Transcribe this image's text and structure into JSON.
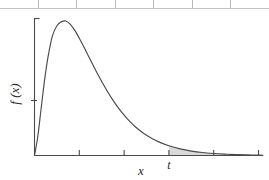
{
  "figure": {
    "title": "",
    "y_axis_label": "f (x)",
    "x_axis_label": "x",
    "t_label": "t",
    "curve_color": "#4a4a4a",
    "axis_color": "#4a4a4a",
    "shade_color": "#d9d9d9",
    "background": "#ffffff"
  },
  "table_strip": {
    "cells": [
      "",
      "",
      "",
      "",
      "",
      "",
      ""
    ],
    "border_color": "#b9b9b9"
  },
  "chart_data": {
    "type": "line",
    "title": "",
    "xlabel": "x",
    "ylabel": "f (x)",
    "xlim": [
      0,
      10.2
    ],
    "ylim": [
      0,
      1.0
    ],
    "grid": false,
    "legend": null,
    "axis_ticks": {
      "x": [
        0,
        2,
        4,
        6,
        8,
        10
      ],
      "x_tick_labels": [
        "",
        "",
        "",
        "t",
        "",
        ""
      ],
      "y": [
        0.3
      ],
      "y_tick_labels": [
        ""
      ]
    },
    "annotations": [
      {
        "text": "t",
        "x": 6,
        "y": 0,
        "role": "critical-value-marker"
      }
    ],
    "shaded_region": {
      "label": "upper tail area",
      "from_x": 6,
      "to_x": 10.2,
      "fill": "#d9d9d9"
    },
    "series": [
      {
        "name": "density",
        "x": [
          0.0,
          0.15,
          0.3,
          0.45,
          0.6,
          0.8,
          1.0,
          1.2,
          1.4,
          1.6,
          1.8,
          2.0,
          2.2,
          2.4,
          2.6,
          2.8,
          3.0,
          3.25,
          3.5,
          3.75,
          4.0,
          4.25,
          4.5,
          4.75,
          5.0,
          5.5,
          6.0,
          6.5,
          7.0,
          7.5,
          8.0,
          8.5,
          9.0,
          9.5,
          10.0,
          10.2
        ],
        "y": [
          0.0,
          0.145,
          0.355,
          0.56,
          0.73,
          0.89,
          0.965,
          0.995,
          1.0,
          0.975,
          0.93,
          0.872,
          0.808,
          0.742,
          0.676,
          0.612,
          0.55,
          0.478,
          0.412,
          0.352,
          0.3,
          0.254,
          0.214,
          0.18,
          0.151,
          0.105,
          0.072,
          0.049,
          0.033,
          0.022,
          0.015,
          0.01,
          0.0065,
          0.0042,
          0.0028,
          0.0022
        ]
      }
    ]
  }
}
